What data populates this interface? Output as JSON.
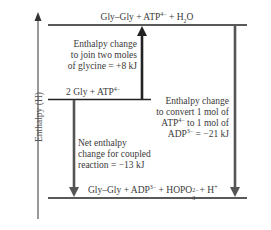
{
  "diagram": {
    "type": "enthalpy-level-diagram",
    "y_axis_label": "Enthalpy (H)",
    "levels": [
      {
        "id": "top",
        "label_parts": [
          "Gly–Gly + ATP",
          "4−",
          " + H",
          "2",
          "O"
        ]
      },
      {
        "id": "middle",
        "label_parts": [
          "2 Gly + ATP",
          "4−"
        ]
      },
      {
        "id": "bottom",
        "label_parts": [
          "Gly–Gly + ADP",
          "3−",
          " + HOPO",
          "2−",
          "3",
          " + H",
          "+"
        ]
      }
    ],
    "arrows": [
      {
        "id": "join-glycine",
        "direction": "up",
        "from": "middle",
        "to": "top",
        "annotation": [
          "Enthalpy change",
          "to join two moles",
          "of glycine = +8 kJ"
        ]
      },
      {
        "id": "atp-to-adp",
        "direction": "down",
        "from": "top",
        "to": "bottom",
        "annotation_parts": [
          "Enthalpy change",
          "to convert 1 mol of",
          "ATP",
          "4−",
          " to 1 mol of",
          "ADP",
          "3−",
          " = −21 kJ"
        ]
      },
      {
        "id": "net-coupled",
        "direction": "down",
        "from": "middle",
        "to": "bottom",
        "annotation": [
          "Net enthalpy",
          "change for coupled",
          "reaction = −13 kJ"
        ]
      }
    ],
    "values": {
      "join_glycine_kJ": 8,
      "atp_to_adp_kJ": -21,
      "net_kJ": -13
    }
  }
}
